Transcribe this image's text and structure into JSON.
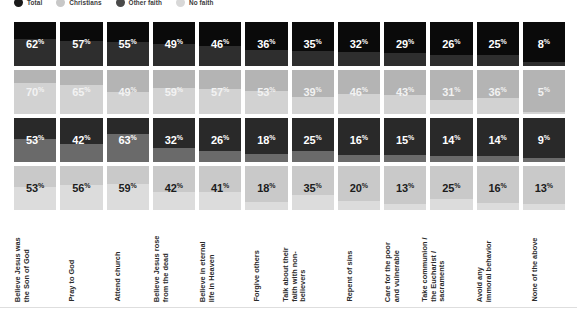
{
  "legend": {
    "items": [
      {
        "label": "Total",
        "color": "#1a1a1a"
      },
      {
        "label": "Christians",
        "color": "#c8c8c8"
      },
      {
        "label": "Other faith",
        "color": "#4a4a4a"
      },
      {
        "label": "No faith",
        "color": "#d8d8d8"
      }
    ]
  },
  "chart_data": {
    "type": "bar",
    "title": "",
    "xlabel": "",
    "ylabel": "",
    "ylim": [
      0,
      100
    ],
    "grid": false,
    "legend_position": "top-left",
    "value_suffix": "%",
    "categories": [
      "Believe Jesus was\nthe Son of God",
      "Pray to God",
      "Attend church",
      "Believe Jesus rose\nfrom the dead",
      "Believe in eternal\nlife in Heaven",
      "Forgive others",
      "Talk about their\nfaith with non-\nbelievers",
      "Repent of sins",
      "Care for the poor\nand vulnerable",
      "Take communion /\nthe Eucharist /\nsacraments",
      "Avoid any\nimmoral behavior",
      "None of the above"
    ],
    "series": [
      {
        "name": "Total",
        "values": [
          62,
          57,
          55,
          49,
          46,
          36,
          35,
          32,
          29,
          26,
          25,
          8
        ]
      },
      {
        "name": "Christians",
        "values": [
          70,
          65,
          49,
          59,
          57,
          53,
          39,
          46,
          43,
          31,
          36,
          5
        ]
      },
      {
        "name": "Other faith",
        "values": [
          53,
          42,
          63,
          32,
          26,
          18,
          25,
          16,
          15,
          14,
          14,
          9
        ]
      },
      {
        "name": "No faith",
        "values": [
          53,
          56,
          59,
          42,
          41,
          18,
          35,
          20,
          13,
          25,
          16,
          13
        ]
      }
    ]
  }
}
